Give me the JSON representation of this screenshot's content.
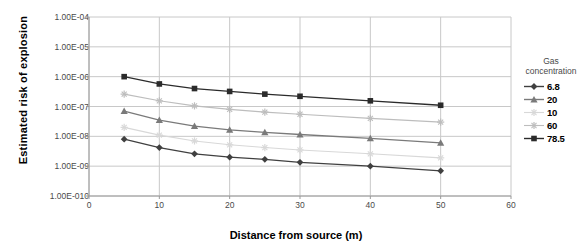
{
  "chart_data": {
    "type": "line",
    "title": "",
    "xlabel": "Distance from source (m)",
    "ylabel": "Estimated risk of explosion",
    "log_y": true,
    "grid": true,
    "legend_position": "right",
    "legend_title": "Gas concentration",
    "xlim": [
      0,
      60
    ],
    "ylim": [
      1e-10,
      0.0001
    ],
    "xticks": [
      "0",
      "10",
      "20",
      "30",
      "40",
      "50",
      "60"
    ],
    "xtick_values": [
      0,
      10,
      20,
      30,
      40,
      50,
      60
    ],
    "yticks": [
      "1.00E-04",
      "1.00E-05",
      "1.00E-06",
      "1.00E-07",
      "1.00E-08",
      "1.00E-09",
      "1.00E-010"
    ],
    "ytick_values": [
      0.0001,
      1e-05,
      1e-06,
      1e-07,
      1e-08,
      1e-09,
      1e-10
    ],
    "x": [
      5,
      10,
      15,
      20,
      25,
      30,
      40,
      50
    ],
    "series": [
      {
        "name": "6.8",
        "marker": "diamond",
        "color": "#404040",
        "values": [
          8e-09,
          4.2e-09,
          2.6e-09,
          2e-09,
          1.7e-09,
          1.35e-09,
          1e-09,
          7e-10
        ]
      },
      {
        "name": "20",
        "marker": "triangle",
        "color": "#7a7a7a",
        "values": [
          7e-08,
          3.5e-08,
          2.2e-08,
          1.65e-08,
          1.35e-08,
          1.15e-08,
          8.5e-09,
          6e-09
        ]
      },
      {
        "name": "10",
        "marker": "star",
        "color": "#d8d8d8",
        "values": [
          2e-08,
          1.1e-08,
          7e-09,
          5.2e-09,
          4.2e-09,
          3.5e-09,
          2.6e-09,
          1.9e-09
        ]
      },
      {
        "name": "60",
        "marker": "star",
        "color": "#bdbdbd",
        "values": [
          2.6e-07,
          1.55e-07,
          1.05e-07,
          8e-08,
          6.5e-08,
          5.5e-08,
          4e-08,
          3e-08
        ]
      },
      {
        "name": "78.5",
        "marker": "square",
        "color": "#2b2b2b",
        "values": [
          1e-06,
          5.7e-07,
          4e-07,
          3.2e-07,
          2.6e-07,
          2.2e-07,
          1.55e-07,
          1.1e-07
        ]
      }
    ]
  },
  "axes": {
    "plot_left": 89,
    "plot_right": 511,
    "plot_top": 17,
    "plot_bottom": 196
  },
  "colors": {
    "grid": "#c8c8c8",
    "axis": "#9a9a9a",
    "plot_background": "#ffffff",
    "tick_text": "#4a4a4a",
    "title_text": "#000000"
  }
}
